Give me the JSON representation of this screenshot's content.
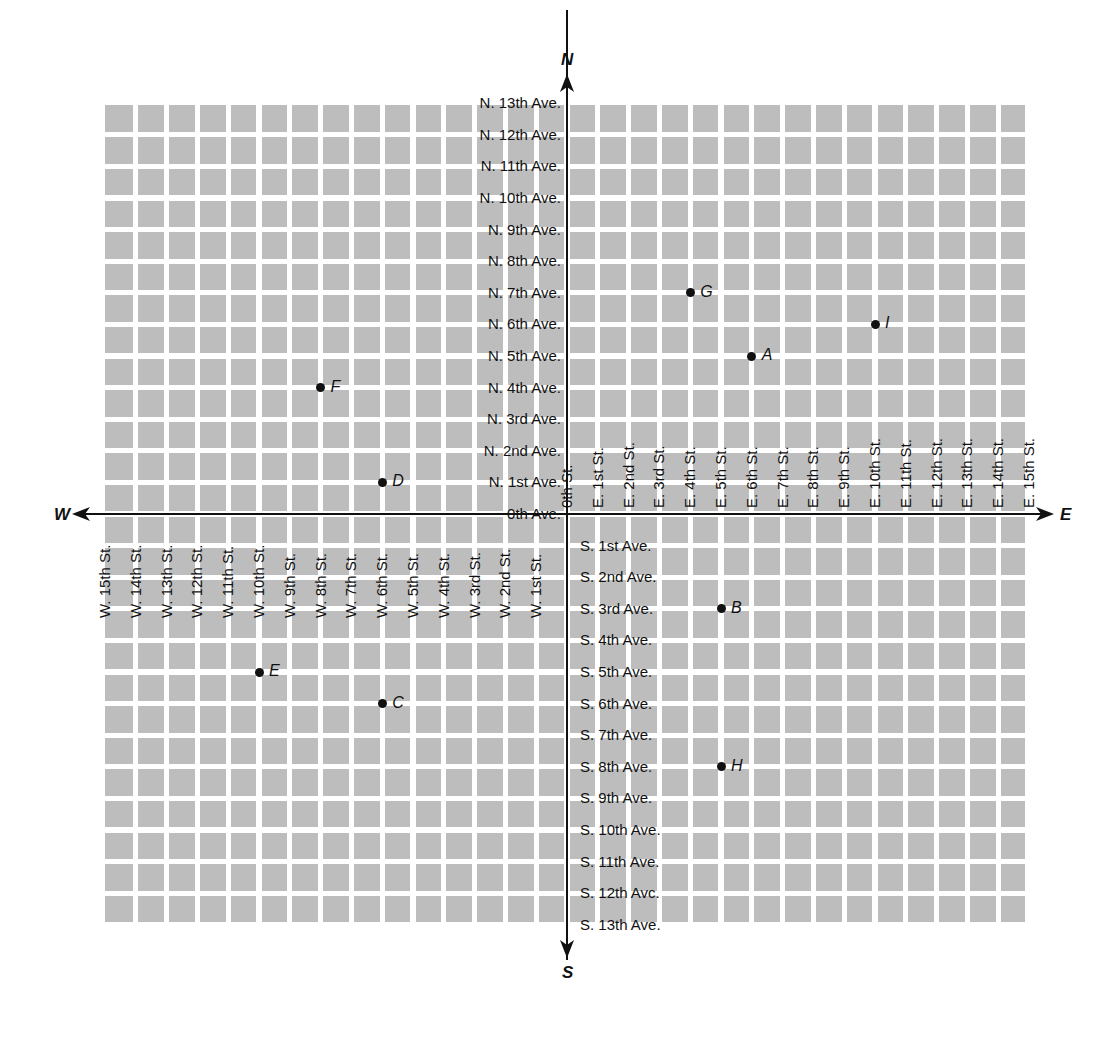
{
  "chart_data": {
    "type": "scatter",
    "title": "",
    "x_axis": {
      "label_negative": "W",
      "label_positive": "E",
      "origin_label": "0th St.",
      "range": [
        -15,
        15
      ],
      "ticks_east": [
        "E. 1st St.",
        "E. 2nd St.",
        "E. 3rd St.",
        "E. 4th St.",
        "E. 5th St.",
        "E. 6th St.",
        "E. 7th St.",
        "E. 8th St.",
        "E. 9th St.",
        "E. 10th St.",
        "E. 11th St.",
        "E. 12th St.",
        "E. 13th St.",
        "E. 14th St.",
        "E. 15th St."
      ],
      "ticks_west": [
        "W. 1st St.",
        "W. 2nd St.",
        "W. 3rd St.",
        "W. 4th St.",
        "W. 5th St.",
        "W. 6th St.",
        "W. 7th St.",
        "W. 8th St.",
        "W. 9th St.",
        "W. 10th St.",
        "W. 11th St.",
        "W. 12th St.",
        "W. 13th St.",
        "W. 14th St.",
        "W. 15th St."
      ]
    },
    "y_axis": {
      "label_positive": "N",
      "label_negative": "S",
      "origin_label": "0th Ave.",
      "range": [
        -13,
        13
      ],
      "ticks_north": [
        "N. 1st Ave.",
        "N. 2nd Ave.",
        "N. 3rd Ave.",
        "N. 4th Ave.",
        "N. 5th Ave.",
        "N. 6th Ave.",
        "N. 7th Ave.",
        "N. 8th Ave.",
        "N. 9th Ave.",
        "N. 10th Ave.",
        "N. 11th Ave.",
        "N. 12th Ave.",
        "N. 13th Ave."
      ],
      "ticks_south": [
        "S. 1st Ave.",
        "S. 2nd Ave.",
        "S. 3rd Ave.",
        "S. 4th Ave.",
        "S. 5th Ave.",
        "S. 6th Ave.",
        "S. 7th Ave.",
        "S. 8th Ave.",
        "S. 9th Ave.",
        "S. 10th Ave.",
        "S. 11th Ave.",
        "S. 12th Avc.",
        "S. 13th Ave."
      ]
    },
    "points": [
      {
        "label": "A",
        "x": 6,
        "y": 5
      },
      {
        "label": "B",
        "x": 5,
        "y": -3
      },
      {
        "label": "C",
        "x": -6,
        "y": -6
      },
      {
        "label": "D",
        "x": -6,
        "y": 1
      },
      {
        "label": "E",
        "x": -10,
        "y": -5
      },
      {
        "label": "F",
        "x": -8,
        "y": 4
      },
      {
        "label": "G",
        "x": 4,
        "y": 7
      },
      {
        "label": "H",
        "x": 5,
        "y": -8
      },
      {
        "label": "I",
        "x": 10,
        "y": 6
      }
    ],
    "grid": true,
    "colors": {
      "block": "#bdbdbd",
      "street": "#ffffff",
      "axis": "#111111",
      "point": "#111111"
    }
  }
}
